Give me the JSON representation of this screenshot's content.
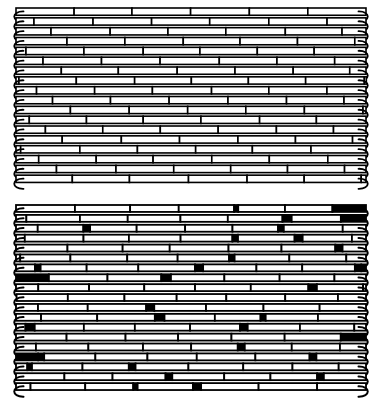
{
  "page": {
    "background_color": "#ffffff",
    "ink_color": "#000000",
    "width": 391,
    "height": 412
  },
  "figures": [
    {
      "id": "figure-top",
      "name": "regular-diagonal-twill",
      "caption": "",
      "x": 18,
      "y": 9,
      "width": 364,
      "height": 181,
      "rows": 18,
      "pattern": "diagonal-twill",
      "selvedge_left": "looped",
      "selvedge_right": "looped",
      "stroke_weight": 1.6,
      "shift_per_row": -17,
      "element_length": 58,
      "float_fill": "#ffffff",
      "binder_fill": "#000000"
    },
    {
      "id": "figure-bottom",
      "name": "irregular-chevron-twill",
      "caption": "",
      "x": 18,
      "y": 206,
      "width": 364,
      "height": 192,
      "rows": 19,
      "pattern": "chevron-broken-twill",
      "selvedge_left": "looped",
      "selvedge_right": "looped",
      "stroke_weight": 1.8,
      "element_length": 52,
      "float_fill": "#ffffff",
      "binder_fill": "#000000"
    }
  ],
  "chart_data": {
    "type": "diagram",
    "subtitle": "",
    "xlabel": "",
    "ylabel": "",
    "legend": [],
    "panels": [
      {
        "name": "regular-diagonal-twill",
        "rows": 18,
        "description": "Continuous diagonal twill; every weft row steps one element to the left, producing unbroken diagonal lines running from upper-right to lower-left.",
        "row_offsets": [
          0,
          -17,
          -34,
          -51,
          -68,
          -85,
          -102,
          -119,
          -136,
          -153,
          -170,
          -187,
          -204,
          -221,
          -238,
          -255,
          -272,
          -289
        ]
      },
      {
        "name": "irregular-chevron-twill",
        "rows": 19,
        "description": "Broken or reversing twill; diagonals change direction at irregular intervals forming chevron and lozenge motifs, with heavy black binder marks.",
        "row_offsets": [
          0,
          -14,
          -28,
          -10,
          6,
          -8,
          -22,
          -36,
          -20,
          -4,
          -18,
          -32,
          -16,
          0,
          -14,
          -28,
          -12,
          4,
          -10
        ]
      }
    ]
  }
}
